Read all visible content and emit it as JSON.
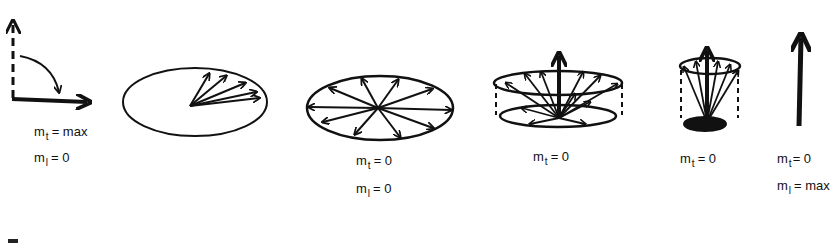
{
  "diagram": {
    "type": "magnetization-relaxation-sequence",
    "stroke_color": "#111111",
    "background": "#ffffff",
    "panels": [
      {
        "id": "panel-1",
        "depiction": "90-degree flip: dashed vertical arrow rotated to solid horizontal arrow via curved arrow",
        "labels": [
          {
            "var": "m",
            "sub": "t",
            "eq": "= max"
          },
          {
            "var": "m",
            "sub": "l",
            "eq": "= 0"
          }
        ]
      },
      {
        "id": "panel-2",
        "depiction": "ellipse with fanned arrows clustered in one direction (dephasing start)",
        "labels": []
      },
      {
        "id": "panel-3",
        "depiction": "ellipse with arrows pointing uniformly in all directions (fully dephased)",
        "labels": [
          {
            "var": "m",
            "sub": "t",
            "eq": "= 0"
          },
          {
            "var": "m",
            "sub": "l",
            "eq": "= 0"
          }
        ]
      },
      {
        "id": "panel-4",
        "depiction": "wide cone: short vertical arrow with spread arrows to upper ellipse, dashed sides",
        "labels": [
          {
            "var": "m",
            "sub": "t",
            "eq": "= 0"
          }
        ]
      },
      {
        "id": "panel-5",
        "depiction": "narrow cone: taller vertical arrow with arrows to upper ellipse, dashed sides",
        "labels": [
          {
            "var": "m",
            "sub": "t",
            "eq": "= 0"
          }
        ]
      },
      {
        "id": "panel-6",
        "depiction": "single solid vertical arrow (full longitudinal recovery)",
        "labels": [
          {
            "var": "m",
            "sub": "t",
            "eq": "= 0"
          },
          {
            "var": "m",
            "sub": "l",
            "eq": "= max"
          }
        ]
      }
    ]
  }
}
